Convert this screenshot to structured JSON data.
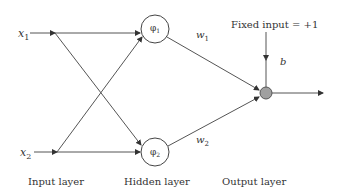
{
  "diagram": {
    "type": "neural-network (RBF) diagram",
    "inputs": [
      {
        "id": "x1",
        "label": "x",
        "sub": "1"
      },
      {
        "id": "x2",
        "label": "x",
        "sub": "2"
      }
    ],
    "hidden": [
      {
        "id": "phi1",
        "label": "φ",
        "sub": "1"
      },
      {
        "id": "phi2",
        "label": "φ",
        "sub": "2"
      }
    ],
    "weights": [
      {
        "id": "w1",
        "label": "w",
        "sub": "1"
      },
      {
        "id": "w2",
        "label": "w",
        "sub": "2"
      }
    ],
    "bias": {
      "label": "b",
      "fixed_input_text": "Fixed input = +1"
    },
    "layer_labels": {
      "input": "Input layer",
      "hidden": "Hidden layer",
      "output": "Output layer"
    },
    "colors": {
      "line": "#333333",
      "output_node_fill": "#a0a0a0",
      "background": "#ffffff"
    }
  }
}
